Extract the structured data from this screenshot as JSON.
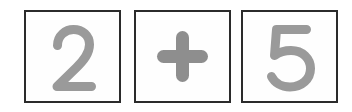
{
  "canvas": {
    "width_px": 352,
    "height_px": 112,
    "background_color": "#ffffff"
  },
  "expression": {
    "text": "2 + 5",
    "operand_left": "2",
    "operator": "+",
    "operand_right": "5"
  },
  "style": {
    "tile_border_color": "#2b2b2b",
    "tile_fill_color": "#fefefe",
    "glyph_color": "#9a9a9a",
    "operator_color": "#8e8e8e"
  },
  "tiles": [
    {
      "index": 1,
      "value": "2",
      "kind": "digit",
      "glyph_name": "digit-two-glyph"
    },
    {
      "index": 2,
      "value": "+",
      "kind": "operator",
      "glyph_name": "plus-sign-icon"
    },
    {
      "index": 3,
      "value": "5",
      "kind": "digit",
      "glyph_name": "digit-five-glyph"
    }
  ]
}
